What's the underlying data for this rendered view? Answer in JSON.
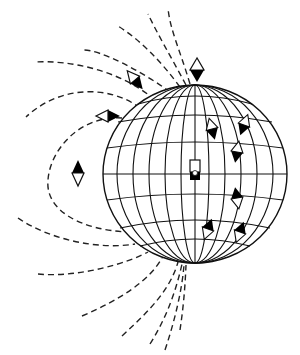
{
  "diagram": {
    "type": "magnetic-field-of-earth",
    "colors": {
      "line": "#111111",
      "background": "#ffffff",
      "needle_dark": "#000000"
    },
    "globe": {
      "cx": 195,
      "cy": 174,
      "rx": 92,
      "ry": 89
    },
    "center_magnet": {
      "label": "",
      "x": 190,
      "y": 166
    },
    "compasses_outside": [
      {
        "x": 197,
        "y": 72,
        "north_down": true
      },
      {
        "x": 135,
        "y": 80,
        "orient": "diagonal"
      },
      {
        "x": 108,
        "y": 116,
        "orient": "horizontal"
      },
      {
        "x": 78,
        "y": 173,
        "north_up": true
      }
    ],
    "compasses_on_globe": [
      {
        "x": 212,
        "y": 129
      },
      {
        "x": 244,
        "y": 125
      },
      {
        "x": 237,
        "y": 152
      },
      {
        "x": 237,
        "y": 198
      },
      {
        "x": 208,
        "y": 229
      },
      {
        "x": 240,
        "y": 232
      }
    ]
  }
}
